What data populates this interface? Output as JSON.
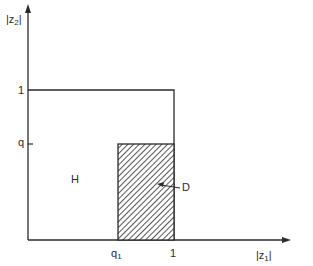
{
  "diagram": {
    "type": "region-plot",
    "colors": {
      "line": "#2a2a2a",
      "background": "#ffffff"
    },
    "axes": {
      "x": {
        "label_prefix": "|z",
        "label_sub": "1",
        "label_suffix": "|"
      },
      "y": {
        "label_prefix": "|z",
        "label_sub": "2",
        "label_suffix": "|"
      }
    },
    "ticks": {
      "x": [
        {
          "main": "q",
          "sub": "1"
        },
        {
          "main": "1",
          "sub": ""
        }
      ],
      "y": [
        {
          "main": "1"
        },
        {
          "main": "q"
        }
      ]
    },
    "regions": [
      {
        "id": "H",
        "label": "H",
        "description": "unit square region bounded by |z1| <= 1, |z2| <= 1"
      },
      {
        "id": "D",
        "label": "D",
        "description": "hatched rectangle q1 <= |z1| <= 1, |z2| <= q"
      }
    ]
  }
}
